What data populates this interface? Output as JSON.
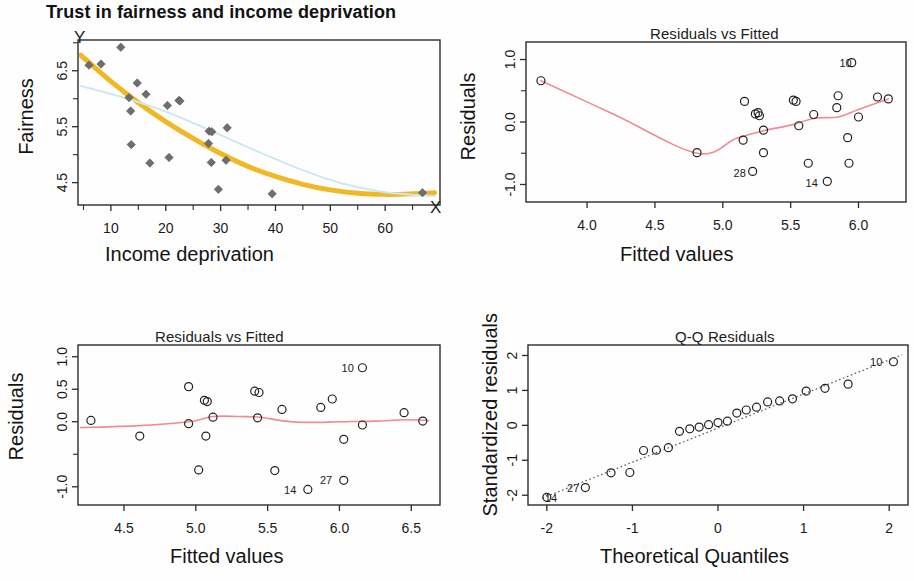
{
  "figure": {
    "main_title": "Trust in fairness and income deprivation",
    "background": "#ffffff"
  },
  "colors": {
    "orange_curve": "#f0b824",
    "blue_curve": "#cde8f2",
    "loess_red": "#f08a96",
    "point_gray": "#6e6e6e",
    "axis": "#2b2b2b",
    "qq_dotted": "#555555"
  },
  "chart_data": [
    {
      "id": "scatter-fairness",
      "type": "scatter",
      "title": "Trust in fairness and income deprivation",
      "xlabel": "Income deprivation",
      "ylabel": "Fairness",
      "corner_x_letter": "X",
      "corner_y_letter": "Y",
      "xlim": [
        4,
        70
      ],
      "ylim": [
        4.1,
        7.05
      ],
      "xticks": [
        10,
        20,
        30,
        40,
        50,
        60
      ],
      "xtick_labels": [
        "10",
        "20",
        "30",
        "40",
        "50",
        "60"
      ],
      "xminor": [
        5,
        15,
        25,
        35,
        45,
        55,
        65
      ],
      "yticks": [
        4.5,
        5.5,
        6.5
      ],
      "ytick_labels": [
        "4.5",
        "5.5",
        "6.5"
      ],
      "yminor": [
        5.0,
        6.0,
        7.0
      ],
      "grid": false,
      "marker": "diamond",
      "points": [
        {
          "x": 6.0,
          "y": 6.6
        },
        {
          "x": 8.2,
          "y": 6.62
        },
        {
          "x": 11.8,
          "y": 6.92
        },
        {
          "x": 13.3,
          "y": 6.02
        },
        {
          "x": 14.8,
          "y": 6.28
        },
        {
          "x": 16.4,
          "y": 6.08
        },
        {
          "x": 13.6,
          "y": 5.78
        },
        {
          "x": 20.3,
          "y": 5.88
        },
        {
          "x": 22.4,
          "y": 5.97
        },
        {
          "x": 13.7,
          "y": 5.18
        },
        {
          "x": 17.1,
          "y": 4.85
        },
        {
          "x": 20.6,
          "y": 4.95
        },
        {
          "x": 27.9,
          "y": 5.42
        },
        {
          "x": 28.4,
          "y": 5.41
        },
        {
          "x": 31.2,
          "y": 5.48
        },
        {
          "x": 27.8,
          "y": 5.2
        },
        {
          "x": 28.3,
          "y": 4.86
        },
        {
          "x": 31.0,
          "y": 4.9
        },
        {
          "x": 29.6,
          "y": 4.38
        },
        {
          "x": 39.4,
          "y": 4.3
        },
        {
          "x": 66.8,
          "y": 4.32
        },
        {
          "x": 22.6,
          "y": 5.96
        }
      ],
      "series": [
        {
          "name": "quadratic-fit",
          "color": "#f0b824",
          "width": 5,
          "points": [
            {
              "x": 4.5,
              "y": 6.78
            },
            {
              "x": 10,
              "y": 6.31
            },
            {
              "x": 15,
              "y": 5.93
            },
            {
              "x": 20,
              "y": 5.59
            },
            {
              "x": 25,
              "y": 5.29
            },
            {
              "x": 30,
              "y": 5.02
            },
            {
              "x": 35,
              "y": 4.79
            },
            {
              "x": 40,
              "y": 4.61
            },
            {
              "x": 45,
              "y": 4.47
            },
            {
              "x": 50,
              "y": 4.37
            },
            {
              "x": 55,
              "y": 4.31
            },
            {
              "x": 60,
              "y": 4.29
            },
            {
              "x": 65,
              "y": 4.3
            },
            {
              "x": 69,
              "y": 4.32
            }
          ]
        },
        {
          "name": "linear-ish-fit",
          "color": "#cde8f2",
          "width": 2,
          "points": [
            {
              "x": 4.5,
              "y": 6.23
            },
            {
              "x": 12,
              "y": 6.03
            },
            {
              "x": 20,
              "y": 5.77
            },
            {
              "x": 28,
              "y": 5.44
            },
            {
              "x": 36,
              "y": 5.09
            },
            {
              "x": 44,
              "y": 4.76
            },
            {
              "x": 52,
              "y": 4.49
            },
            {
              "x": 60,
              "y": 4.33
            },
            {
              "x": 69,
              "y": 4.26
            }
          ]
        }
      ]
    },
    {
      "id": "resid-vs-fitted-top",
      "type": "scatter",
      "title": "Residuals vs Fitted",
      "xlabel": "Fitted values",
      "ylabel": "Residuals",
      "xlim": [
        3.55,
        6.35
      ],
      "ylim": [
        -1.28,
        1.28
      ],
      "xticks": [
        4.0,
        4.5,
        5.0,
        5.5,
        6.0
      ],
      "xtick_labels": [
        "4.0",
        "4.5",
        "5.0",
        "5.5",
        "6.0"
      ],
      "yticks": [
        -1.0,
        0.0,
        1.0
      ],
      "ytick_labels": [
        "-1.0",
        "0.0",
        "1.0"
      ],
      "yminor": [
        -0.5,
        0.5
      ],
      "grid": false,
      "marker": "circle",
      "points": [
        {
          "x": 3.66,
          "y": 0.66
        },
        {
          "x": 5.16,
          "y": 0.33
        },
        {
          "x": 5.15,
          "y": -0.29
        },
        {
          "x": 5.24,
          "y": 0.13
        },
        {
          "x": 5.26,
          "y": 0.15
        },
        {
          "x": 5.27,
          "y": 0.1
        },
        {
          "x": 5.3,
          "y": -0.13
        },
        {
          "x": 5.3,
          "y": -0.49
        },
        {
          "x": 5.22,
          "y": -0.79,
          "label": "28"
        },
        {
          "x": 5.52,
          "y": 0.35
        },
        {
          "x": 5.54,
          "y": 0.33
        },
        {
          "x": 5.56,
          "y": -0.06
        },
        {
          "x": 5.67,
          "y": 0.12
        },
        {
          "x": 5.63,
          "y": -0.66
        },
        {
          "x": 5.77,
          "y": -0.95,
          "label": "14"
        },
        {
          "x": 5.85,
          "y": 0.42
        },
        {
          "x": 5.84,
          "y": 0.23
        },
        {
          "x": 5.92,
          "y": -0.25
        },
        {
          "x": 5.93,
          "y": -0.66
        },
        {
          "x": 6.0,
          "y": 0.08
        },
        {
          "x": 6.14,
          "y": 0.4
        },
        {
          "x": 6.22,
          "y": 0.37
        },
        {
          "x": 5.95,
          "y": 0.95,
          "label": "10",
          "label_only": true
        },
        {
          "x": 4.81,
          "y": -0.49
        }
      ],
      "loess": {
        "name": "loess-smooth",
        "color": "#f08a96",
        "width": 1.6,
        "points": [
          {
            "x": 3.66,
            "y": 0.66
          },
          {
            "x": 4.2,
            "y": 0.12
          },
          {
            "x": 4.81,
            "y": -0.5
          },
          {
            "x": 5.1,
            "y": -0.26
          },
          {
            "x": 5.3,
            "y": -0.14
          },
          {
            "x": 5.5,
            "y": -0.05
          },
          {
            "x": 5.68,
            "y": 0.06
          },
          {
            "x": 5.85,
            "y": 0.08
          },
          {
            "x": 6.0,
            "y": 0.2
          },
          {
            "x": 6.22,
            "y": 0.37
          }
        ]
      },
      "labels": [
        {
          "text": "10",
          "x": 5.95,
          "y": 0.95
        },
        {
          "text": "28",
          "x": 5.17,
          "y": -0.82
        },
        {
          "text": "14",
          "x": 5.7,
          "y": -0.97
        }
      ]
    },
    {
      "id": "resid-vs-fitted-bottom",
      "type": "scatter",
      "title": "Residuals vs Fitted",
      "xlabel": "Fitted values",
      "ylabel": "Residuals",
      "xlim": [
        4.18,
        6.7
      ],
      "ylim": [
        -1.28,
        1.18
      ],
      "xticks": [
        4.5,
        5.0,
        5.5,
        6.0,
        6.5
      ],
      "xtick_labels": [
        "4.5",
        "5.0",
        "5.5",
        "6.0",
        "6.5"
      ],
      "yticks": [
        -1.0,
        0.0,
        0.5,
        1.0
      ],
      "ytick_labels": [
        "-1.0",
        "0.0",
        "0.5",
        "1.0"
      ],
      "yminor": [
        -0.5
      ],
      "grid": false,
      "marker": "circle",
      "points": [
        {
          "x": 4.27,
          "y": 0.02
        },
        {
          "x": 4.61,
          "y": -0.22
        },
        {
          "x": 4.95,
          "y": 0.54
        },
        {
          "x": 4.95,
          "y": -0.03
        },
        {
          "x": 5.06,
          "y": 0.33
        },
        {
          "x": 5.08,
          "y": 0.31
        },
        {
          "x": 5.02,
          "y": -0.74
        },
        {
          "x": 5.07,
          "y": -0.22
        },
        {
          "x": 5.12,
          "y": 0.07
        },
        {
          "x": 5.41,
          "y": 0.47
        },
        {
          "x": 5.44,
          "y": 0.45
        },
        {
          "x": 5.43,
          "y": 0.06
        },
        {
          "x": 5.55,
          "y": -0.75
        },
        {
          "x": 5.6,
          "y": 0.19
        },
        {
          "x": 5.78,
          "y": -1.04,
          "label": "14"
        },
        {
          "x": 5.87,
          "y": 0.22
        },
        {
          "x": 5.95,
          "y": 0.35
        },
        {
          "x": 6.03,
          "y": -0.27
        },
        {
          "x": 6.03,
          "y": -0.9,
          "label": "27"
        },
        {
          "x": 6.16,
          "y": -0.05
        },
        {
          "x": 6.45,
          "y": 0.14
        },
        {
          "x": 6.58,
          "y": 0.01
        },
        {
          "x": 6.16,
          "y": 0.83,
          "label": "10",
          "label_only": true
        }
      ],
      "loess": {
        "name": "loess-smooth",
        "color": "#f08a96",
        "width": 1.6,
        "points": [
          {
            "x": 4.2,
            "y": -0.09
          },
          {
            "x": 4.6,
            "y": -0.06
          },
          {
            "x": 4.95,
            "y": 0.0
          },
          {
            "x": 5.12,
            "y": 0.08
          },
          {
            "x": 5.3,
            "y": 0.08
          },
          {
            "x": 5.45,
            "y": 0.07
          },
          {
            "x": 5.62,
            "y": 0.01
          },
          {
            "x": 5.8,
            "y": -0.01
          },
          {
            "x": 6.0,
            "y": 0.0
          },
          {
            "x": 6.25,
            "y": 0.01
          },
          {
            "x": 6.45,
            "y": 0.03
          },
          {
            "x": 6.62,
            "y": 0.02
          }
        ]
      },
      "labels": [
        {
          "text": "10",
          "x": 6.1,
          "y": 0.83
        },
        {
          "text": "14",
          "x": 5.7,
          "y": -1.05
        },
        {
          "text": "27",
          "x": 5.95,
          "y": -0.9
        }
      ]
    },
    {
      "id": "qq-residuals",
      "type": "scatter",
      "title": "Q-Q Residuals",
      "xlabel": "Theoretical Quantiles",
      "ylabel": "Standardized residuals",
      "xlim": [
        -2.22,
        2.22
      ],
      "ylim": [
        -2.28,
        2.3
      ],
      "xticks": [
        -2,
        -1,
        0,
        1,
        2
      ],
      "xtick_labels": [
        "-2",
        "-1",
        "0",
        "1",
        "2"
      ],
      "yticks": [
        -2,
        -1,
        0,
        1,
        2
      ],
      "ytick_labels": [
        "-2",
        "-1",
        "0",
        "1",
        "2"
      ],
      "grid": false,
      "marker": "circle",
      "reference_line": {
        "name": "qq-reference-line",
        "style": "dotted",
        "points": [
          {
            "x": -2.05,
            "y": -2.08
          },
          {
            "x": 2.15,
            "y": 2.02
          }
        ]
      },
      "points": [
        {
          "x": -2.0,
          "y": -2.06,
          "label": "14"
        },
        {
          "x": -1.55,
          "y": -1.78,
          "label": "27",
          "label_only": true
        },
        {
          "x": -1.25,
          "y": -1.36
        },
        {
          "x": -1.03,
          "y": -1.35
        },
        {
          "x": -0.87,
          "y": -0.72
        },
        {
          "x": -0.72,
          "y": -0.71
        },
        {
          "x": -0.58,
          "y": -0.64
        },
        {
          "x": -0.45,
          "y": -0.17
        },
        {
          "x": -0.33,
          "y": -0.1
        },
        {
          "x": -0.22,
          "y": -0.05
        },
        {
          "x": -0.11,
          "y": 0.02
        },
        {
          "x": 0.0,
          "y": 0.08
        },
        {
          "x": 0.11,
          "y": 0.12
        },
        {
          "x": 0.22,
          "y": 0.35
        },
        {
          "x": 0.33,
          "y": 0.44
        },
        {
          "x": 0.45,
          "y": 0.52
        },
        {
          "x": 0.58,
          "y": 0.67
        },
        {
          "x": 0.72,
          "y": 0.7
        },
        {
          "x": 0.87,
          "y": 0.76
        },
        {
          "x": 1.03,
          "y": 0.98
        },
        {
          "x": 1.25,
          "y": 1.06
        },
        {
          "x": 1.52,
          "y": 1.18
        },
        {
          "x": 2.05,
          "y": 1.82,
          "label": "10",
          "label_only": true
        }
      ],
      "labels": [
        {
          "text": "14",
          "x": -1.88,
          "y": -2.08
        },
        {
          "text": "27",
          "x": -1.62,
          "y": -1.78
        },
        {
          "text": "10",
          "x": 1.92,
          "y": 1.82
        }
      ]
    }
  ]
}
